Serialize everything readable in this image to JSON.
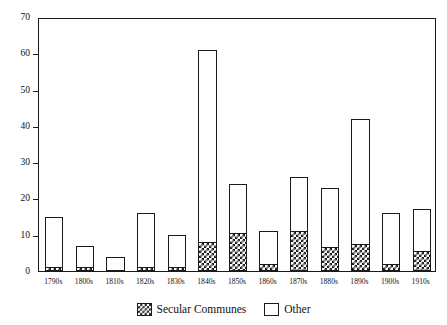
{
  "chart_data": {
    "type": "bar",
    "stacked": true,
    "title": "",
    "subtitle": "",
    "xlabel": "",
    "ylabel": "",
    "ylim": [
      0,
      70
    ],
    "ytick_values": [
      0,
      10,
      20,
      30,
      40,
      50,
      60,
      70
    ],
    "ytick_labels": [
      "0",
      "10",
      "20",
      "30",
      "40",
      "50",
      "60",
      "70"
    ],
    "grid": false,
    "legend_position": "bottom-center",
    "categories": [
      "1790s",
      "1800s",
      "1810s",
      "1820s",
      "1830s",
      "1840s",
      "1850s",
      "1860s",
      "1870s",
      "1880s",
      "1890s",
      "1900s",
      "1910s"
    ],
    "series": [
      {
        "name": "Secular Communes",
        "color": "#1a1a1a",
        "fill": "checkerboard-hatch",
        "values": [
          1,
          1,
          0,
          1,
          1,
          8,
          10.5,
          2,
          11,
          6.5,
          7.5,
          2,
          5.5
        ]
      },
      {
        "name": "Other",
        "color": "#ffffff",
        "fill": "solid-white-outline",
        "values": [
          14,
          6,
          4,
          15,
          9,
          53,
          13.5,
          9,
          15,
          16.5,
          34.5,
          14,
          11.5
        ]
      }
    ],
    "totals": [
      15,
      7,
      4,
      16,
      10,
      61,
      24,
      11,
      26,
      23,
      42,
      16,
      17
    ]
  },
  "legend": {
    "items": [
      {
        "label": "Secular Communes",
        "swatch": "hatched"
      },
      {
        "label": "Other",
        "swatch": "plain"
      }
    ]
  }
}
